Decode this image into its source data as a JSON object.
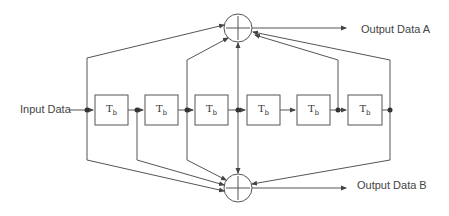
{
  "diagram": {
    "type": "convolutional-encoder",
    "input_label": "Input Data",
    "output_a_label": "Output Data A",
    "output_b_label": "Output Data B",
    "delay_blocks": [
      {
        "label": "T",
        "sub": "b"
      },
      {
        "label": "T",
        "sub": "b"
      },
      {
        "label": "T",
        "sub": "b"
      },
      {
        "label": "T",
        "sub": "b"
      },
      {
        "label": "T",
        "sub": "b"
      },
      {
        "label": "T",
        "sub": "b"
      }
    ],
    "adders": [
      {
        "id": "adder-a",
        "symbol": "+"
      },
      {
        "id": "adder-b",
        "symbol": "+"
      }
    ],
    "taps_to_adder_a": [
      0,
      2,
      3,
      5,
      6
    ],
    "taps_to_adder_b": [
      0,
      1,
      2,
      3,
      6
    ],
    "colors": {
      "line": "#555555",
      "text": "#444444",
      "background": "#ffffff"
    }
  }
}
